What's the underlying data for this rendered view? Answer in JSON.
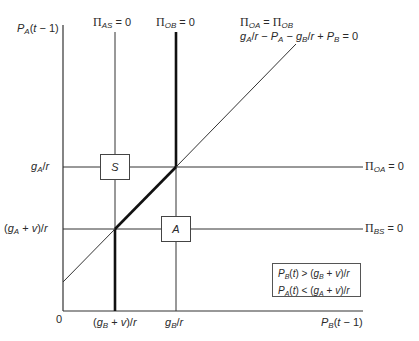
{
  "diagram": {
    "type": "phase-diagram",
    "axes": {
      "y_label": "P_A(t − 1)",
      "x_label": "P_B(t − 1)",
      "origin_label": "0"
    },
    "y_ticks": [
      {
        "label": "g_A/r",
        "value_desc": "upper threshold"
      },
      {
        "label": "(g_A + v)/r",
        "value_desc": "lower threshold"
      }
    ],
    "x_ticks": [
      {
        "label": "(g_B + v)/r"
      },
      {
        "label": "g_B/r"
      }
    ],
    "lines": [
      {
        "id": "pi_as",
        "label": "Π_AS = 0",
        "orientation": "vertical",
        "at": "(g_B + v)/r",
        "thick_segment": "below (g_A + v)/r"
      },
      {
        "id": "pi_ob",
        "label": "Π_OB = 0",
        "orientation": "vertical",
        "at": "g_B/r",
        "thick_segment": "above g_A/r"
      },
      {
        "id": "pi_oa",
        "label": "Π_OA = 0",
        "orientation": "horizontal",
        "at": "g_A/r"
      },
      {
        "id": "pi_bs",
        "label": "Π_BS = 0",
        "orientation": "horizontal",
        "at": "(g_A + v)/r"
      },
      {
        "id": "diagonal",
        "label_line1": "Π_OA = Π_OB",
        "label_line2": "g_A/r − P_A − g_B/r + P_B = 0",
        "orientation": "diagonal",
        "thick_segment": "between intersections"
      }
    ],
    "regions": [
      {
        "label": "S"
      },
      {
        "label": "A"
      }
    ],
    "condition_box": {
      "line1": "P_B(t) > (g_B + v)/r",
      "line2": "P_A(t) < (g_A + v)/r"
    }
  }
}
